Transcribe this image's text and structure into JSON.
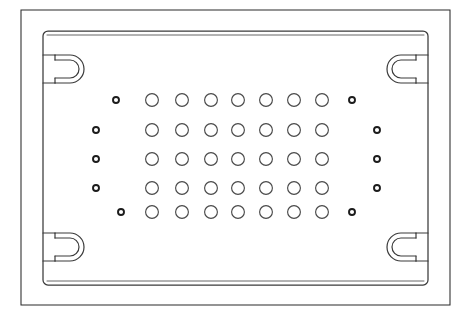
{
  "drawing": {
    "title": "Perforated rectangular plate",
    "description": "Technical line drawing of a rectangular perforated panel with four corner hook slots and a grid of circular holes",
    "canvas": {
      "width": 474,
      "height": 319
    },
    "colors": {
      "background": "#ffffff",
      "outer_frame_stroke": "#2b2b2b",
      "plate_stroke": "#3a3a3a",
      "lip_stroke": "#555555",
      "large_hole_stroke": "#4a4a4a",
      "small_hole_stroke": "#1c1c1c"
    },
    "outer_frame": {
      "x": 21,
      "y": 10,
      "width": 429,
      "height": 295
    },
    "plate": {
      "x": 43,
      "y": 31,
      "width": 385,
      "height": 254,
      "corner_radius": 5,
      "lip_offset": 4
    },
    "notches": [
      {
        "name": "notch-top-left",
        "cx": 55,
        "cy": 69,
        "opens": "right"
      },
      {
        "name": "notch-top-right",
        "cx": 416,
        "cy": 69,
        "opens": "left"
      },
      {
        "name": "notch-bottom-left",
        "cx": 55,
        "cy": 247,
        "opens": "right"
      },
      {
        "name": "notch-bottom-right",
        "cx": 416,
        "cy": 247,
        "opens": "left"
      }
    ],
    "hole_grid": {
      "large_radius": 6.4,
      "small_radius": 3.0,
      "row_y": [
        100,
        130,
        159,
        188,
        212
      ],
      "rows": [
        {
          "index": 1,
          "label": "hole-row-1",
          "holes": [
            {
              "cx": 116,
              "cy": 100,
              "size": "small"
            },
            {
              "cx": 152,
              "cy": 100,
              "size": "large"
            },
            {
              "cx": 182,
              "cy": 100,
              "size": "large"
            },
            {
              "cx": 211,
              "cy": 100,
              "size": "large"
            },
            {
              "cx": 238,
              "cy": 100,
              "size": "large"
            },
            {
              "cx": 266,
              "cy": 100,
              "size": "large"
            },
            {
              "cx": 294,
              "cy": 100,
              "size": "large"
            },
            {
              "cx": 322,
              "cy": 100,
              "size": "large"
            },
            {
              "cx": 352,
              "cy": 100,
              "size": "small"
            }
          ]
        },
        {
          "index": 2,
          "label": "hole-row-2",
          "holes": [
            {
              "cx": 96,
              "cy": 130,
              "size": "small"
            },
            {
              "cx": 152,
              "cy": 130,
              "size": "large"
            },
            {
              "cx": 182,
              "cy": 130,
              "size": "large"
            },
            {
              "cx": 211,
              "cy": 130,
              "size": "large"
            },
            {
              "cx": 238,
              "cy": 130,
              "size": "large"
            },
            {
              "cx": 266,
              "cy": 130,
              "size": "large"
            },
            {
              "cx": 294,
              "cy": 130,
              "size": "large"
            },
            {
              "cx": 322,
              "cy": 130,
              "size": "large"
            },
            {
              "cx": 377,
              "cy": 130,
              "size": "small"
            }
          ]
        },
        {
          "index": 3,
          "label": "hole-row-3",
          "holes": [
            {
              "cx": 96,
              "cy": 159,
              "size": "small"
            },
            {
              "cx": 152,
              "cy": 159,
              "size": "large"
            },
            {
              "cx": 182,
              "cy": 159,
              "size": "large"
            },
            {
              "cx": 211,
              "cy": 159,
              "size": "large"
            },
            {
              "cx": 238,
              "cy": 159,
              "size": "large"
            },
            {
              "cx": 266,
              "cy": 159,
              "size": "large"
            },
            {
              "cx": 294,
              "cy": 159,
              "size": "large"
            },
            {
              "cx": 322,
              "cy": 159,
              "size": "large"
            },
            {
              "cx": 377,
              "cy": 159,
              "size": "small"
            }
          ]
        },
        {
          "index": 4,
          "label": "hole-row-4",
          "holes": [
            {
              "cx": 96,
              "cy": 188,
              "size": "small"
            },
            {
              "cx": 152,
              "cy": 188,
              "size": "large"
            },
            {
              "cx": 182,
              "cy": 188,
              "size": "large"
            },
            {
              "cx": 211,
              "cy": 188,
              "size": "large"
            },
            {
              "cx": 238,
              "cy": 188,
              "size": "large"
            },
            {
              "cx": 266,
              "cy": 188,
              "size": "large"
            },
            {
              "cx": 294,
              "cy": 188,
              "size": "large"
            },
            {
              "cx": 322,
              "cy": 188,
              "size": "large"
            },
            {
              "cx": 377,
              "cy": 188,
              "size": "small"
            }
          ]
        },
        {
          "index": 5,
          "label": "hole-row-5",
          "holes": [
            {
              "cx": 121,
              "cy": 212,
              "size": "small"
            },
            {
              "cx": 152,
              "cy": 212,
              "size": "large"
            },
            {
              "cx": 182,
              "cy": 212,
              "size": "large"
            },
            {
              "cx": 211,
              "cy": 212,
              "size": "large"
            },
            {
              "cx": 238,
              "cy": 212,
              "size": "large"
            },
            {
              "cx": 266,
              "cy": 212,
              "size": "large"
            },
            {
              "cx": 294,
              "cy": 212,
              "size": "large"
            },
            {
              "cx": 322,
              "cy": 212,
              "size": "large"
            },
            {
              "cx": 352,
              "cy": 212,
              "size": "small"
            }
          ]
        }
      ]
    }
  }
}
